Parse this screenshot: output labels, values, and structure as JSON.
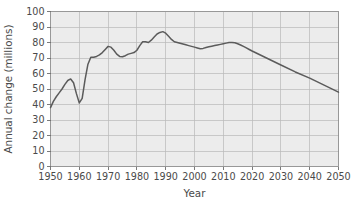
{
  "chart_data": {
    "type": "line",
    "title": "",
    "xlabel": "Year",
    "ylabel": "Annual change (millions)",
    "xlim": [
      1950,
      2050
    ],
    "ylim": [
      0,
      100
    ],
    "grid": true,
    "legend": null,
    "x_ticks": [
      1950,
      1960,
      1970,
      1980,
      1990,
      2000,
      2010,
      2020,
      2030,
      2040,
      2050
    ],
    "y_ticks": [
      0,
      10,
      20,
      30,
      40,
      50,
      60,
      70,
      80,
      90,
      100
    ],
    "line_color": "#5b5b5b",
    "series": [
      {
        "name": "World population annual change",
        "x": [
          1950,
          1951,
          1952,
          1953,
          1954,
          1955,
          1956,
          1957,
          1958,
          1959,
          1960,
          1961,
          1962,
          1963,
          1964,
          1965,
          1966,
          1967,
          1968,
          1969,
          1970,
          1971,
          1972,
          1973,
          1974,
          1975,
          1976,
          1977,
          1978,
          1979,
          1980,
          1981,
          1982,
          1983,
          1984,
          1985,
          1986,
          1987,
          1988,
          1989,
          1990,
          1991,
          1992,
          1993,
          1994,
          1995,
          1996,
          1997,
          1998,
          1999,
          2000,
          2001,
          2002,
          2003,
          2004,
          2005,
          2006,
          2007,
          2008,
          2009,
          2010,
          2011,
          2012,
          2013,
          2014,
          2015,
          2016,
          2017,
          2018,
          2019,
          2020,
          2025,
          2030,
          2035,
          2040,
          2045,
          2050
        ],
        "y": [
          38,
          42,
          45,
          47.5,
          50,
          53,
          55.5,
          56.5,
          54,
          47,
          41,
          44,
          56,
          66,
          70.5,
          70.5,
          71,
          72,
          73.5,
          75.5,
          77.5,
          77,
          75,
          72.5,
          71,
          70.8,
          71.5,
          72.5,
          73,
          73.5,
          75,
          78,
          80.5,
          80.5,
          80,
          81.5,
          83.5,
          85.5,
          86.5,
          87,
          86,
          84,
          82,
          80.5,
          80,
          79.5,
          79,
          78.5,
          78,
          77.5,
          77,
          76.5,
          76,
          76.2,
          76.8,
          77.2,
          77.6,
          78,
          78.4,
          78.8,
          79.2,
          79.6,
          80,
          80,
          79.8,
          79.2,
          78.4,
          77.5,
          76.5,
          75.5,
          74.5,
          70,
          65.5,
          61,
          57,
          52.5,
          48
        ]
      }
    ]
  },
  "axis": {
    "x_title": "Year",
    "y_title": "Annual change (millions)"
  },
  "x_tick_labels": [
    "1950",
    "1960",
    "1970",
    "1980",
    "1990",
    "2000",
    "2010",
    "2020",
    "2030",
    "2040",
    "2050"
  ],
  "y_tick_labels": [
    "0",
    "10",
    "20",
    "30",
    "40",
    "50",
    "60",
    "70",
    "80",
    "90",
    "100"
  ]
}
